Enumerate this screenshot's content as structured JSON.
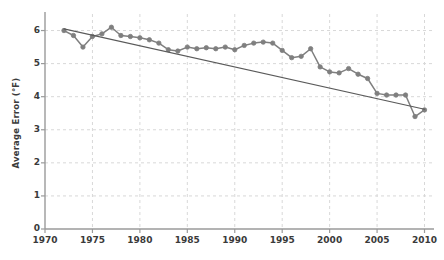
{
  "chart_data": {
    "type": "line",
    "title": "",
    "subtitle": "",
    "xlabel": "",
    "ylabel": "Average Error (°F)",
    "xlim": [
      1970,
      2011
    ],
    "ylim": [
      0,
      6.5
    ],
    "xticks": [
      1970,
      1975,
      1980,
      1985,
      1990,
      1995,
      2000,
      2005,
      2010
    ],
    "xticklabels": [
      "1970",
      "1975",
      "1980",
      "1985",
      "1990",
      "1995",
      "2000",
      "2005",
      "2010"
    ],
    "yticks": [
      0,
      1,
      2,
      3,
      4,
      5,
      6
    ],
    "yticklabels": [
      "0",
      "1",
      "2",
      "3",
      "4",
      "5",
      "6"
    ],
    "grid": true,
    "grid_style": "dashed",
    "legend": null,
    "legend_position": "none",
    "series": [
      {
        "name": "Average Error",
        "kind": "line-markers",
        "color": "#7f7f7f",
        "marker": "circle",
        "x": [
          1972,
          1973,
          1974,
          1975,
          1976,
          1977,
          1978,
          1979,
          1980,
          1981,
          1982,
          1983,
          1984,
          1985,
          1986,
          1987,
          1988,
          1989,
          1990,
          1991,
          1992,
          1993,
          1994,
          1995,
          1996,
          1997,
          1998,
          1999,
          2000,
          2001,
          2002,
          2003,
          2004,
          2005,
          2006,
          2007,
          2008,
          2009,
          2010
        ],
        "values": [
          6.0,
          5.85,
          5.5,
          5.82,
          5.9,
          6.1,
          5.85,
          5.82,
          5.78,
          5.72,
          5.62,
          5.42,
          5.38,
          5.5,
          5.45,
          5.48,
          5.45,
          5.5,
          5.42,
          5.55,
          5.62,
          5.65,
          5.62,
          5.4,
          5.18,
          5.22,
          5.45,
          4.9,
          4.75,
          4.72,
          4.85,
          4.68,
          4.55,
          4.1,
          4.05,
          4.05,
          4.05,
          3.4,
          3.6
        ]
      },
      {
        "name": "Linear trend",
        "kind": "line",
        "color": "#5a5a5a",
        "marker": "none",
        "x": [
          1972,
          2010
        ],
        "values": [
          6.05,
          3.62
        ]
      }
    ],
    "axis_color": "#9a9a9a",
    "grid_color": "#d8d8d8",
    "text_color": "#3a3a3a",
    "background": "#ffffff"
  }
}
